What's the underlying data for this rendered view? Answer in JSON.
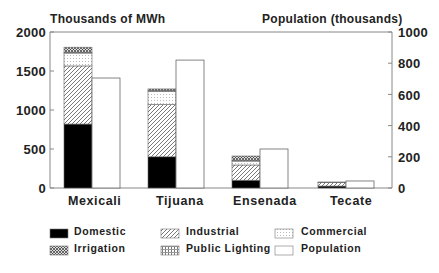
{
  "chart_data": {
    "type": "bar",
    "title": "",
    "left_axis_title": "Thousands of MWh",
    "right_axis_title": "Population (thousands)",
    "xlabel": "",
    "ylabel": "Thousands of MWh",
    "y2label": "Population (thousands)",
    "ylim": [
      0,
      2000
    ],
    "y2lim": [
      0,
      1000
    ],
    "yticks": [
      0,
      500,
      1000,
      1500,
      2000
    ],
    "y2ticks": [
      0,
      200,
      400,
      600,
      800,
      1000
    ],
    "categories": [
      "Mexicali",
      "Tijuana",
      "Ensenada",
      "Tecate"
    ],
    "stacked_series_axis": "left",
    "series": [
      {
        "name": "Domestic",
        "pattern": "solid-black",
        "values": [
          820,
          400,
          100,
          25
        ]
      },
      {
        "name": "Industrial",
        "pattern": "diagonal-hatch",
        "values": [
          745,
          670,
          195,
          45
        ]
      },
      {
        "name": "Commercial",
        "pattern": "light-dots",
        "values": [
          165,
          170,
          50,
          0
        ]
      },
      {
        "name": "Public Lighting",
        "pattern": "grid-dots",
        "values": [
          10,
          10,
          10,
          2
        ]
      },
      {
        "name": "Irrigation",
        "pattern": "dense-crosshatch",
        "values": [
          65,
          20,
          55,
          5
        ]
      },
      {
        "name": "Population",
        "pattern": "white",
        "axis": "right",
        "values": [
          705,
          820,
          250,
          45
        ]
      }
    ],
    "grid": false,
    "legend_position": "bottom"
  },
  "legend": [
    {
      "label": "Domestic",
      "pattern": "solid-black"
    },
    {
      "label": "Industrial",
      "pattern": "diagonal-hatch"
    },
    {
      "label": "Commercial",
      "pattern": "light-dots"
    },
    {
      "label": "Irrigation",
      "pattern": "dense-crosshatch"
    },
    {
      "label": "Public Lighting",
      "pattern": "grid-dots"
    },
    {
      "label": "Population",
      "pattern": "white"
    }
  ],
  "labels": {
    "left_axis_title": "Thousands of MWh",
    "right_axis_title": "Population (thousands)",
    "left_ticks": [
      "2000",
      "1500",
      "1000",
      "500",
      "0"
    ],
    "right_ticks": [
      "1000",
      "800",
      "600",
      "400",
      "200",
      "0"
    ],
    "categories": [
      "Mexicali",
      "Tijuana",
      "Ensenada",
      "Tecate"
    ]
  }
}
